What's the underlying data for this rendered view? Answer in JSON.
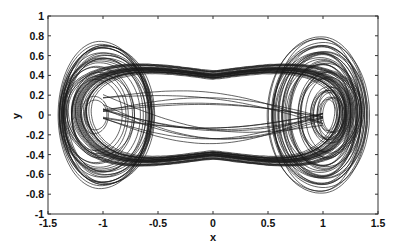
{
  "chart_data": {
    "type": "line",
    "title": "",
    "xlabel": "x",
    "ylabel": "y",
    "xlim": [
      -1.5,
      1.5
    ],
    "ylim": [
      -1,
      1
    ],
    "xticks": [
      -1.5,
      -1,
      -0.5,
      0,
      0.5,
      1,
      1.5
    ],
    "xtick_labels": [
      "-1.5",
      "-1",
      "-0.5",
      "0",
      "0.5",
      "1",
      "1.5"
    ],
    "yticks": [
      -1,
      -0.8,
      -0.6,
      -0.4,
      -0.2,
      0,
      0.2,
      0.4,
      0.6,
      0.8,
      1
    ],
    "ytick_labels": [
      "-1",
      "-0.8",
      "-0.6",
      "-0.4",
      "-0.2",
      "0",
      "0.2",
      "0.4",
      "0.6",
      "0.8",
      "1"
    ],
    "grid": false,
    "legend": null,
    "series": [
      {
        "name": "trajectory",
        "color": "#1a1a1a",
        "approx_extent": {
          "x": [
            -1.4,
            1.42
          ],
          "y": [
            -0.82,
            0.82
          ]
        },
        "scroll_centers": [
          [
            -1.05,
            0.0
          ],
          [
            1.1,
            0.0
          ]
        ]
      }
    ]
  },
  "plot": {
    "axes_box": {
      "left": 48,
      "top": 16,
      "right": 378,
      "bottom": 214
    },
    "line_color": "#1a1a1a",
    "frame_color": "#333333"
  }
}
